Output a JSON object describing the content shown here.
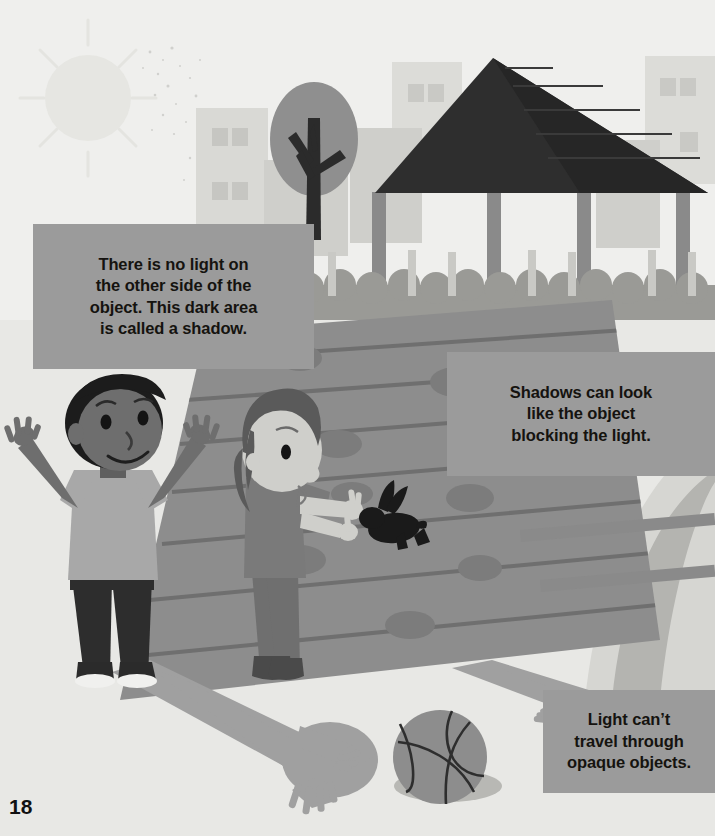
{
  "page": {
    "number": "18",
    "width": 715,
    "height": 836,
    "background_color": "#f2f2f0"
  },
  "captions": [
    {
      "id": "caption-shadow-definition",
      "text": "There is no light on\nthe other side of the\nobject. This dark area\nis called a shadow.",
      "background_color": "#9b9b9b",
      "text_color": "#15130f"
    },
    {
      "id": "caption-shadow-shape",
      "text": "Shadows can look\nlike the object\nblocking the light.",
      "background_color": "#9b9b9b",
      "text_color": "#15130f"
    },
    {
      "id": "caption-opaque-objects",
      "text": "Light can’t\ntravel through\nopaque objects.",
      "background_color": "#9b9b9b",
      "text_color": "#15130f"
    }
  ],
  "illustration": {
    "description": "Two children playing outside in bright sunlight on a wooden deck beside a gazebo, casting long shadows; the girl makes a rabbit hand-shadow puppet.",
    "sky_color": "#efefed",
    "ground_color": "#e8e8e5",
    "elements": [
      {
        "name": "sun",
        "label": "sun",
        "color": "#e6e6e2",
        "rays": 12
      },
      {
        "name": "city-buildings",
        "label": "background buildings",
        "color": "#d6d6d2"
      },
      {
        "name": "tree",
        "label": "tree with bare branches",
        "canopy_color": "#8f8f8f",
        "trunk_color": "#2b2b2b"
      },
      {
        "name": "gazebo",
        "label": "gazebo shelter",
        "roof_color": "#2e2e2e",
        "post_color": "#8a8a8a"
      },
      {
        "name": "fence",
        "label": "picket fence",
        "color": "#c9c9c5"
      },
      {
        "name": "hedge",
        "label": "hedge row",
        "color": "#9a9a96"
      },
      {
        "name": "deck",
        "label": "wooden deck planks",
        "color": "#8d8d8d"
      },
      {
        "name": "boy",
        "label": "boy with arms raised",
        "shirt_color": "#a8a8a8",
        "pants_color": "#2d2d2d",
        "skin_color": "#6e6e6e",
        "hair_color": "#1c1c1c"
      },
      {
        "name": "girl",
        "label": "girl making a hand shadow",
        "shirt_color": "#7a7a7a",
        "pants_color": "#6f6f6f",
        "skin_color": "#cfcfcb",
        "hair_color": "#5a5a5a"
      },
      {
        "name": "rabbit-shadow",
        "label": "rabbit hand-shadow puppet",
        "color": "#1a1a1a"
      },
      {
        "name": "ball",
        "label": "volleyball",
        "color": "#8d8d8d"
      },
      {
        "name": "boy-shadow",
        "label": "boy cast shadow",
        "color": "#a0a0a0"
      },
      {
        "name": "girl-shadow",
        "label": "girl cast shadow",
        "color": "#a0a0a0"
      }
    ]
  }
}
